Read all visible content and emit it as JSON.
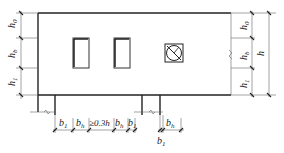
{
  "diagram": {
    "type": "elevation-dimension-drawing",
    "left_dims": {
      "top": {
        "main": "h",
        "sub": "0"
      },
      "middle": {
        "main": "h",
        "sub": "b"
      },
      "bottom": {
        "main": "h",
        "sub": "1"
      }
    },
    "right_dims": {
      "top": {
        "main": "h",
        "sub": "0"
      },
      "middle": {
        "main": "h",
        "sub": "b"
      },
      "bottom": {
        "main": "h",
        "sub": "1"
      },
      "total": {
        "main": "h"
      }
    },
    "bottom_dims": [
      {
        "main": "b",
        "sub": "1"
      },
      {
        "main": "b",
        "sub": "h"
      },
      {
        "main": "≥0.3h",
        "sub": ""
      },
      {
        "main": "b",
        "sub": "h"
      },
      {
        "main": "b",
        "sub": "1"
      }
    ],
    "right_bottom_dims": [
      {
        "main": "b",
        "sub": "1"
      },
      {
        "main": "b",
        "sub": "h"
      }
    ],
    "openings": [
      "rectangular-opening",
      "rectangular-opening",
      "circular-duct-opening"
    ]
  }
}
